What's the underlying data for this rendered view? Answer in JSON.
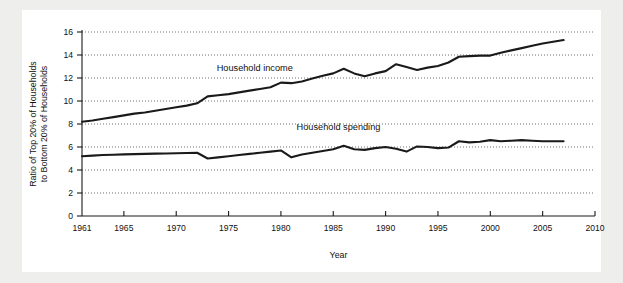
{
  "figure": {
    "background_color": "#eeeeec",
    "plate_color": "#ffffff",
    "line_color": "#1a1a1a"
  },
  "chart_data": {
    "type": "line",
    "title": "",
    "subtitle": "",
    "xlabel": "Year",
    "ylabel": "Ratio of Top 20% of Households to Bottom 20% of Households",
    "ylabel_line1": "Ratio of Top 20% of Households",
    "ylabel_line2": "to Bottom 20% of Households",
    "xlim": [
      1961,
      2010
    ],
    "ylim": [
      0,
      16
    ],
    "xticks": [
      1961,
      1965,
      1970,
      1975,
      1980,
      1985,
      1990,
      1995,
      2000,
      2005,
      2010
    ],
    "xtick_labels": [
      "1961",
      "1965",
      "1970",
      "1975",
      "1980",
      "1985",
      "1990",
      "1995",
      "2000",
      "2005",
      "2010"
    ],
    "yticks": [
      0,
      2,
      4,
      6,
      8,
      10,
      12,
      14,
      16
    ],
    "ytick_labels": [
      "0",
      "2",
      "4",
      "6",
      "8",
      "10",
      "12",
      "14",
      "16"
    ],
    "grid": true,
    "grid_axis": "y",
    "grid_style": "dotted",
    "legend": "inline-annotation",
    "legend_position": "in-plot",
    "annotations": [
      {
        "text": "Household income",
        "x": 1977.5,
        "y": 12.6
      },
      {
        "text": "Household spending",
        "x": 1985.5,
        "y": 7.5
      }
    ],
    "x": [
      1961,
      1962,
      1963,
      1964,
      1965,
      1966,
      1967,
      1968,
      1969,
      1970,
      1971,
      1972,
      1973,
      1974,
      1975,
      1976,
      1977,
      1978,
      1979,
      1980,
      1981,
      1982,
      1983,
      1984,
      1985,
      1986,
      1987,
      1988,
      1989,
      1990,
      1991,
      1992,
      1993,
      1994,
      1995,
      1996,
      1997,
      1998,
      1999,
      2000,
      2001,
      2002,
      2003,
      2004,
      2005,
      2006,
      2007
    ],
    "series": [
      {
        "name": "Household income",
        "values": [
          8.2,
          8.3,
          8.45,
          8.6,
          8.75,
          8.9,
          9.0,
          9.15,
          9.3,
          9.45,
          9.6,
          9.8,
          10.4,
          10.5,
          10.6,
          10.75,
          10.9,
          11.05,
          11.2,
          11.6,
          11.55,
          11.7,
          11.95,
          12.2,
          12.4,
          12.8,
          12.4,
          12.15,
          12.4,
          12.6,
          13.2,
          12.95,
          12.7,
          12.9,
          13.05,
          13.35,
          13.85,
          13.9,
          13.95,
          13.95,
          14.2,
          14.4,
          14.6,
          14.8,
          15.0,
          15.15,
          15.3
        ]
      },
      {
        "name": "Household spending",
        "values": [
          5.2,
          5.25,
          5.3,
          5.33,
          5.36,
          5.38,
          5.4,
          5.42,
          5.44,
          5.46,
          5.48,
          5.5,
          5.0,
          5.1,
          5.2,
          5.3,
          5.4,
          5.5,
          5.6,
          5.7,
          5.1,
          5.35,
          5.5,
          5.65,
          5.8,
          6.1,
          5.8,
          5.75,
          5.9,
          6.0,
          5.85,
          5.6,
          6.05,
          6.0,
          5.9,
          5.95,
          6.5,
          6.4,
          6.45,
          6.6,
          6.5,
          6.55,
          6.6,
          6.55,
          6.5,
          6.5,
          6.5
        ]
      }
    ]
  }
}
